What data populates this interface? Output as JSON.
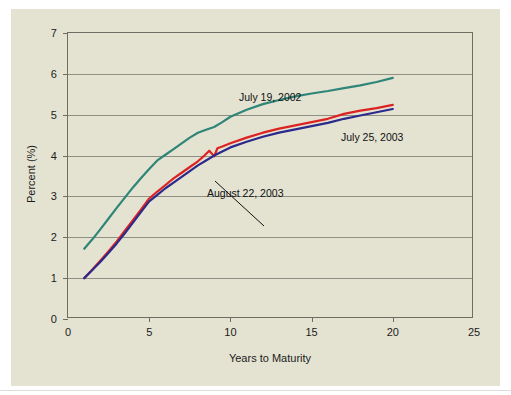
{
  "figure": {
    "background_color": "#e4e3d2",
    "frame_color": "#ffffff",
    "plot_border_color": "#6d6d63",
    "grid_color": "#8f8f84"
  },
  "chart_data": {
    "type": "line",
    "title": "",
    "xlabel": "Years to Maturity",
    "ylabel": "Percent (%)",
    "xlim": [
      0,
      25
    ],
    "ylim": [
      0,
      7
    ],
    "xticks": [
      0,
      5,
      10,
      15,
      20,
      25
    ],
    "yticks": [
      0,
      1,
      2,
      3,
      4,
      5,
      6,
      7
    ],
    "xtick_labels": [
      "0",
      "5",
      "10",
      "15",
      "20",
      "25"
    ],
    "ytick_labels": [
      "0",
      "1",
      "2",
      "3",
      "4",
      "5",
      "6",
      "7"
    ],
    "grid": "horizontal",
    "legend_position": "inline-annotations",
    "series": [
      {
        "name": "July 19, 2002",
        "color": "#2e8578",
        "x": [
          1.0,
          1.5,
          2.0,
          2.5,
          3.0,
          3.5,
          4.0,
          4.5,
          5.0,
          5.5,
          6.0,
          6.5,
          7.0,
          7.5,
          8.0,
          8.5,
          9.0,
          9.5,
          10.0,
          11.0,
          12.0,
          13.0,
          14.0,
          15.0,
          16.0,
          17.0,
          18.0,
          19.0,
          20.0
        ],
        "y": [
          1.72,
          1.95,
          2.2,
          2.46,
          2.72,
          2.97,
          3.22,
          3.45,
          3.67,
          3.88,
          4.02,
          4.16,
          4.3,
          4.44,
          4.56,
          4.63,
          4.7,
          4.82,
          4.95,
          5.12,
          5.26,
          5.36,
          5.45,
          5.52,
          5.58,
          5.65,
          5.72,
          5.8,
          5.9
        ]
      },
      {
        "name": "August 22, 2003",
        "color": "#dd2222",
        "x": [
          1.0,
          1.5,
          2.0,
          2.5,
          3.0,
          3.5,
          4.0,
          4.5,
          5.0,
          5.5,
          6.0,
          6.5,
          7.0,
          7.5,
          8.0,
          8.4,
          8.7,
          9.0,
          9.2,
          9.5,
          10.0,
          11.0,
          12.0,
          13.0,
          14.0,
          15.0,
          16.0,
          17.0,
          18.0,
          19.0,
          20.0
        ],
        "y": [
          1.0,
          1.21,
          1.43,
          1.66,
          1.9,
          2.16,
          2.42,
          2.68,
          2.95,
          3.12,
          3.28,
          3.44,
          3.58,
          3.72,
          3.86,
          4.0,
          4.12,
          3.98,
          4.18,
          4.22,
          4.3,
          4.44,
          4.56,
          4.66,
          4.74,
          4.82,
          4.9,
          5.02,
          5.1,
          5.16,
          5.24
        ]
      },
      {
        "name": "July 25, 2003",
        "color": "#2a2a8c",
        "x": [
          1.0,
          1.5,
          2.0,
          2.5,
          3.0,
          3.5,
          4.0,
          4.5,
          5.0,
          5.5,
          6.0,
          6.5,
          7.0,
          7.5,
          8.0,
          8.5,
          9.0,
          9.5,
          10.0,
          11.0,
          12.0,
          13.0,
          14.0,
          15.0,
          16.0,
          17.0,
          18.0,
          19.0,
          20.0
        ],
        "y": [
          1.0,
          1.2,
          1.4,
          1.62,
          1.85,
          2.1,
          2.36,
          2.62,
          2.88,
          3.04,
          3.2,
          3.34,
          3.48,
          3.62,
          3.76,
          3.88,
          4.0,
          4.1,
          4.2,
          4.34,
          4.46,
          4.56,
          4.64,
          4.72,
          4.8,
          4.9,
          4.98,
          5.06,
          5.14
        ]
      }
    ],
    "annotations": [
      {
        "text": "July 19, 2002",
        "x_px": 228,
        "y_px": 82
      },
      {
        "text": "July 25, 2003",
        "x_px": 330,
        "y_px": 122
      },
      {
        "text": "August 22, 2003",
        "x_px": 196,
        "y_px": 178
      }
    ]
  }
}
